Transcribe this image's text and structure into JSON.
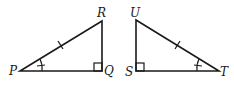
{
  "diagram": {
    "triangle_left": {
      "vertices": {
        "P": "P",
        "Q": "Q",
        "R": "R"
      },
      "right_angle_at": "Q",
      "marked_angle_at": "P",
      "marked_side": "PR"
    },
    "triangle_right": {
      "vertices": {
        "U": "U",
        "S": "S",
        "T": "T"
      },
      "right_angle_at": "S",
      "marked_angle_at": "T",
      "marked_side": "UT"
    },
    "colors": {
      "stroke": "#1a1a1a",
      "background": "#ffffff"
    }
  }
}
